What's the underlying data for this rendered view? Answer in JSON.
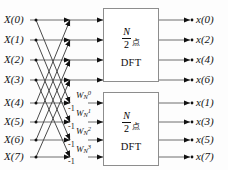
{
  "figure": {
    "colors": {
      "line": "#6e6e6e",
      "arrow": "#111111",
      "box_border": "#8d8d8d",
      "text": "#141414",
      "background": "#fdfdfd"
    }
  },
  "inputs": [
    {
      "label": "X(0)",
      "y": 20
    },
    {
      "label": "X(1)",
      "y": 40
    },
    {
      "label": "X(2)",
      "y": 60
    },
    {
      "label": "X(3)",
      "y": 80
    },
    {
      "label": "X(4)",
      "y": 103
    },
    {
      "label": "X(5)",
      "y": 122
    },
    {
      "label": "X(6)",
      "y": 140
    },
    {
      "label": "X(7)",
      "y": 157
    }
  ],
  "outputs": [
    {
      "label": "x(0)",
      "y": 20
    },
    {
      "label": "x(2)",
      "y": 40
    },
    {
      "label": "x(4)",
      "y": 60
    },
    {
      "label": "x(6)",
      "y": 80
    },
    {
      "label": "x(1)",
      "y": 103
    },
    {
      "label": "x(3)",
      "y": 122
    },
    {
      "label": "x(5)",
      "y": 140
    },
    {
      "label": "x(7)",
      "y": 157
    }
  ],
  "twiddle_factors": [
    {
      "base": "W",
      "sub": "N",
      "sup": "0",
      "y": 96
    },
    {
      "base": "W",
      "sub": "N",
      "sup": "1",
      "y": 114
    },
    {
      "base": "W",
      "sub": "N",
      "sup": "2",
      "y": 132
    },
    {
      "base": "W",
      "sub": "N",
      "sup": "3",
      "y": 150
    }
  ],
  "minus_one_labels": [
    {
      "label": "-1",
      "y": 108
    },
    {
      "label": "-1",
      "y": 126
    },
    {
      "label": "-1",
      "y": 144
    },
    {
      "label": "-1",
      "y": 161
    }
  ],
  "blocks": [
    {
      "name": "upper-dft-block",
      "numerator": "N",
      "denominator": "2",
      "unit": "点",
      "transform": "DFT",
      "x": 103,
      "y": 8,
      "w": 56,
      "h": 74
    },
    {
      "name": "lower-dft-block",
      "numerator": "N",
      "denominator": "2",
      "unit": "点",
      "transform": "DFT",
      "x": 103,
      "y": 92,
      "w": 56,
      "h": 74
    }
  ]
}
